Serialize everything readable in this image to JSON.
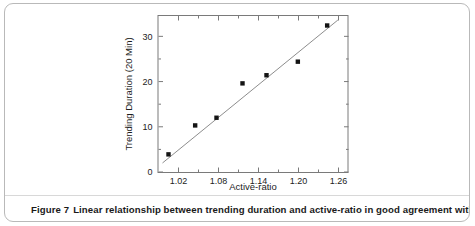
{
  "figure": {
    "caption_number": "Figure 7",
    "caption_text": "Linear relationship between trending duration and active-ratio in good agreement with the"
  },
  "chart_data": {
    "type": "scatter",
    "title": "",
    "xlabel": "Active-ratio",
    "ylabel": "Trending Duration (20 Min)",
    "xlim": [
      0.99,
      1.275
    ],
    "ylim": [
      0,
      34.5
    ],
    "xticks": [
      1.02,
      1.08,
      1.14,
      1.2,
      1.26
    ],
    "xticklabels": [
      "1.02",
      "1.08",
      "1.14",
      "1.20",
      "1.26"
    ],
    "yticks": [
      0,
      10,
      20,
      30
    ],
    "yticklabels": [
      "0",
      "10",
      "20",
      "30"
    ],
    "x_minor_ticks": [
      1.05,
      1.11,
      1.17,
      1.23
    ],
    "y_minor_ticks": [
      5,
      15,
      25
    ],
    "grid": false,
    "legend": null,
    "marker": "square",
    "marker_color": "#141414",
    "line_color": "#8d8d8d",
    "frame_color": "#7a7a7a",
    "points": [
      {
        "x": 1.005,
        "y": 3.9
      },
      {
        "x": 1.045,
        "y": 10.3
      },
      {
        "x": 1.077,
        "y": 12.0
      },
      {
        "x": 1.116,
        "y": 19.6
      },
      {
        "x": 1.152,
        "y": 21.4
      },
      {
        "x": 1.199,
        "y": 24.4
      },
      {
        "x": 1.243,
        "y": 32.4
      }
    ],
    "fit_line": {
      "x_start": 0.996,
      "y_start": 2.0,
      "x_end": 1.259,
      "y_end": 33.6
    }
  }
}
